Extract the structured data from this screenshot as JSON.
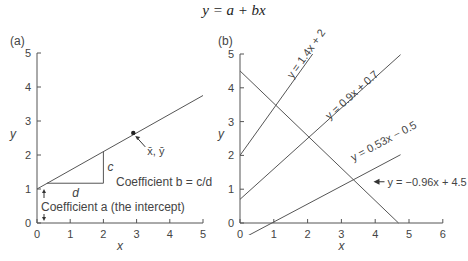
{
  "figure_title": "y = a + bx",
  "chart_data": [
    {
      "type": "line",
      "panel_label": "(a)",
      "title": "",
      "xlabel": "x",
      "ylabel": "y",
      "xlim": [
        0,
        5
      ],
      "ylim": [
        0,
        5
      ],
      "x_ticks": [
        0,
        1,
        2,
        3,
        4,
        5
      ],
      "y_ticks": [
        0,
        1,
        2,
        3,
        4,
        5
      ],
      "grid": false,
      "series": [
        {
          "name": "regression line",
          "intercept": 1.0,
          "slope": 0.55,
          "x": [
            0,
            5
          ],
          "y": [
            1.0,
            3.75
          ]
        }
      ],
      "points": [
        {
          "name": "mean point",
          "label": "x̄, ȳ",
          "x": 2.9,
          "y": 2.65
        }
      ],
      "slope_triangle": {
        "x_start": 0.3,
        "x_end": 2.0,
        "y_base": 1.17,
        "y_top": 2.1,
        "horizontal_label": "d",
        "vertical_label": "c"
      },
      "annotations": [
        {
          "text": "Coefficient b = c/d",
          "x": 2.4,
          "y": 1.2
        },
        {
          "text": "Coefficient a (the intercept)",
          "x": 0.15,
          "y": 0.5
        }
      ]
    },
    {
      "type": "line",
      "panel_label": "(b)",
      "title": "",
      "xlabel": "x",
      "ylabel": "y",
      "xlim": [
        0,
        6
      ],
      "ylim": [
        0,
        5
      ],
      "x_ticks": [
        0,
        1,
        2,
        3,
        4,
        5,
        6
      ],
      "y_ticks": [
        0,
        1,
        2,
        3,
        4,
        5
      ],
      "grid": false,
      "series": [
        {
          "name": "y = 1.4x + 2",
          "slope": 1.4,
          "intercept": 2,
          "x": [
            0,
            2.15
          ],
          "y": [
            2,
            5.0
          ]
        },
        {
          "name": "y = 0.9x + 0.7",
          "slope": 0.9,
          "intercept": 0.7,
          "x": [
            0,
            4.75
          ],
          "y": [
            0.7,
            4.98
          ]
        },
        {
          "name": "y = 0.53x − 0.5",
          "slope": 0.53,
          "intercept": -0.5,
          "x": [
            0,
            4.75
          ],
          "y": [
            -0.5,
            2.02
          ]
        },
        {
          "name": "y = −0.96x + 4.5",
          "slope": -0.96,
          "intercept": 4.5,
          "x": [
            0,
            4.69
          ],
          "y": [
            4.5,
            0
          ]
        }
      ]
    }
  ]
}
